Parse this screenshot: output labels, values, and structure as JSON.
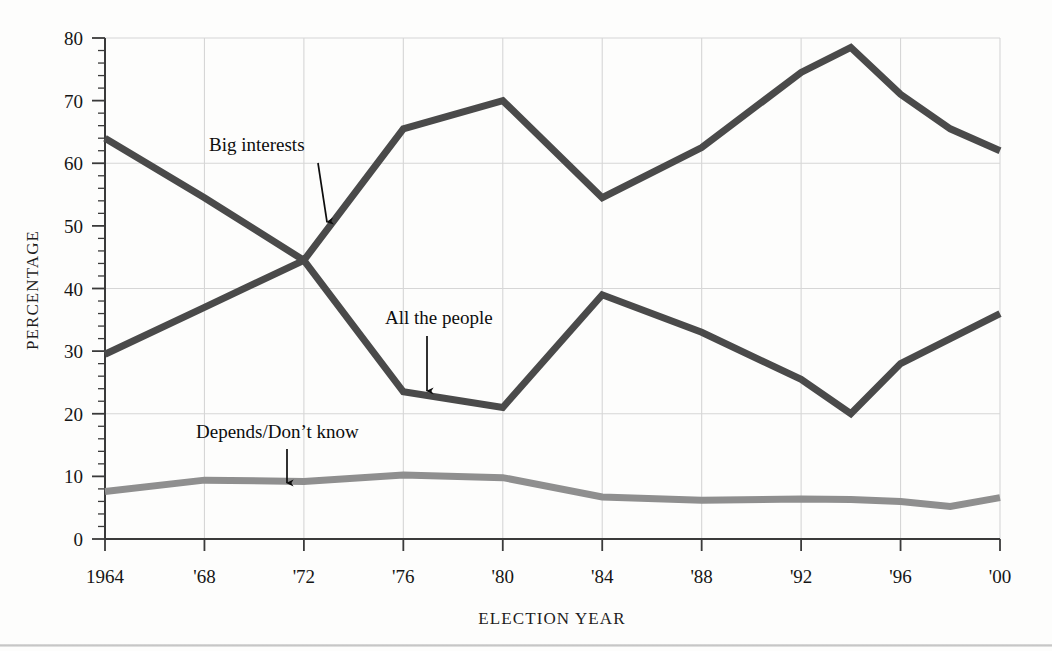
{
  "figure": {
    "background_color": "#fdfdfc",
    "plot": {
      "left": 105,
      "right": 1000,
      "top": 38,
      "bottom": 539
    }
  },
  "axes": {
    "y_title": "PERCENTAGE",
    "x_title": "ELECTION YEAR",
    "y_ticks": [
      "0",
      "10",
      "20",
      "30",
      "40",
      "50",
      "60",
      "70",
      "80"
    ],
    "x_ticks": [
      "1964",
      "'68",
      "'72",
      "'76",
      "'80",
      "'84",
      "'88",
      "'92",
      "'96",
      "'00"
    ]
  },
  "annotations": [
    {
      "id": "big-interests",
      "text": "Big interests",
      "x": 209,
      "y": 151,
      "arrow": {
        "x1": 318,
        "y1": 163,
        "x2": 327,
        "y2": 222
      }
    },
    {
      "id": "all-the-people",
      "text": "All the people",
      "x": 385,
      "y": 324,
      "arrow": {
        "x1": 427,
        "y1": 336,
        "x2": 427,
        "y2": 391
      }
    },
    {
      "id": "depends-dont-know",
      "text": "Depends/Don’t know",
      "x": 196,
      "y": 438,
      "arrow": {
        "x1": 287,
        "y1": 449,
        "x2": 287,
        "y2": 483
      }
    }
  ],
  "style": {
    "dark_line_color": "#4a4a4a",
    "light_line_color": "#8f8f8f",
    "gridline_color": "#d6d6d6",
    "axis_color": "#3a3a3a",
    "dark_line_width": 7,
    "light_line_width": 7
  },
  "chart_data": {
    "type": "line",
    "title": "",
    "xlabel": "ELECTION YEAR",
    "ylabel": "PERCENTAGE",
    "xlim": [
      1964,
      2000
    ],
    "ylim": [
      0,
      80
    ],
    "y_major_gridlines": [
      20,
      40,
      60,
      80
    ],
    "y_tick_step": 10,
    "y_minor_tick_step": 2,
    "grid": true,
    "legend": "inline annotations",
    "series": [
      {
        "name": "Big interests",
        "color": "#4a4a4a",
        "x": [
          1964,
          1968,
          1972,
          1976,
          1980,
          1984,
          1988,
          1992,
          1994,
          1996,
          1998,
          2000
        ],
        "values": [
          64.0,
          54.5,
          44.5,
          65.5,
          70.0,
          54.5,
          62.5,
          74.5,
          78.5,
          71.0,
          65.5,
          62.0
        ]
      },
      {
        "name": "All the people",
        "color": "#4a4a4a",
        "x": [
          1964,
          1968,
          1972,
          1976,
          1980,
          1984,
          1988,
          1992,
          1994,
          1996,
          1998,
          2000
        ],
        "values": [
          29.5,
          37.0,
          44.5,
          23.5,
          21.0,
          39.0,
          33.0,
          25.5,
          20.0,
          28.0,
          32.0,
          36.0
        ]
      },
      {
        "name": "Depends/Don't know",
        "color": "#8f8f8f",
        "x": [
          1964,
          1968,
          1972,
          1976,
          1980,
          1984,
          1988,
          1992,
          1994,
          1996,
          1998,
          2000
        ],
        "values": [
          7.6,
          9.4,
          9.2,
          10.2,
          9.8,
          6.7,
          6.2,
          6.4,
          6.3,
          6.0,
          5.2,
          6.6
        ]
      }
    ]
  }
}
